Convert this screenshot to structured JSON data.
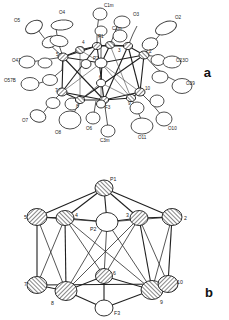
{
  "figure": {
    "type": "crystal-structure-ortep",
    "panels": [
      {
        "id": "a",
        "letter": "a",
        "description": "Thermal ellipsoid (ORTEP) plot of the full cluster with oxygen and carbon ligand atoms labelled",
        "labels": [
          {
            "text": "O5",
            "x": 14,
            "y": 22
          },
          {
            "text": "O4",
            "x": 59,
            "y": 14
          },
          {
            "text": "C1m",
            "x": 104,
            "y": 7
          },
          {
            "text": "C2m",
            "x": 112,
            "y": 30
          },
          {
            "text": "O3",
            "x": 133,
            "y": 16
          },
          {
            "text": "O2",
            "x": 175,
            "y": 19
          },
          {
            "text": "P1",
            "x": 98,
            "y": 38
          },
          {
            "text": "O47",
            "x": 12,
            "y": 62
          },
          {
            "text": "O23O",
            "x": 176,
            "y": 62
          },
          {
            "text": "O57B",
            "x": 6,
            "y": 82
          },
          {
            "text": "O29",
            "x": 186,
            "y": 85
          },
          {
            "text": "P2",
            "x": 93,
            "y": 60
          },
          {
            "text": "O7",
            "x": 22,
            "y": 122
          },
          {
            "text": "O8",
            "x": 55,
            "y": 131
          },
          {
            "text": "O6",
            "x": 86,
            "y": 128
          },
          {
            "text": "C3m",
            "x": 106,
            "y": 137
          },
          {
            "text": "F3",
            "x": 107,
            "y": 107
          },
          {
            "text": "O11",
            "x": 144,
            "y": 136
          },
          {
            "text": "O10",
            "x": 168,
            "y": 127
          },
          {
            "text": "2",
            "x": 146,
            "y": 52
          },
          {
            "text": "3",
            "x": 118,
            "y": 50
          },
          {
            "text": "4",
            "x": 83,
            "y": 45
          },
          {
            "text": "5",
            "x": 60,
            "y": 55
          },
          {
            "text": "6",
            "x": 100,
            "y": 81
          },
          {
            "text": "7",
            "x": 59,
            "y": 90
          },
          {
            "text": "8",
            "x": 78,
            "y": 99
          },
          {
            "text": "9",
            "x": 131,
            "y": 96
          },
          {
            "text": "10",
            "x": 144,
            "y": 89
          }
        ]
      },
      {
        "id": "b",
        "letter": "b",
        "description": "Polyhedral metal-atom core of the cluster with phosphorus P1, P2 and fluorine F3 positions",
        "labels": [
          {
            "text": "P1",
            "x": 111,
            "y": 23
          },
          {
            "text": "5",
            "x": 26,
            "y": 59
          },
          {
            "text": "4",
            "x": 75,
            "y": 59
          },
          {
            "text": "3",
            "x": 125,
            "y": 59
          },
          {
            "text": "2",
            "x": 182,
            "y": 61
          },
          {
            "text": "P2",
            "x": 92,
            "y": 72
          },
          {
            "text": "6",
            "x": 110,
            "y": 117
          },
          {
            "text": "7",
            "x": 26,
            "y": 126
          },
          {
            "text": "10",
            "x": 175,
            "y": 125
          },
          {
            "text": "8",
            "x": 51,
            "y": 144
          },
          {
            "text": "9",
            "x": 163,
            "y": 144
          },
          {
            "text": "F3",
            "x": 115,
            "y": 157
          }
        ]
      }
    ],
    "colors": {
      "background": "#ffffff",
      "line": "#2b2b2b",
      "label": "#222222",
      "panel_letter": "#111111"
    }
  }
}
